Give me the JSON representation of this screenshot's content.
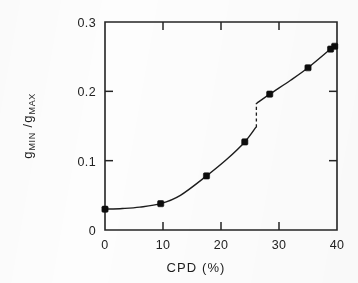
{
  "figure": {
    "background_color": "#fdfdfd",
    "ink_color": "#1c1c1c",
    "marker_color": "#0d0d0d"
  },
  "chart_data": {
    "type": "line",
    "title": "",
    "subtitle": "",
    "xlabel": "CPD (%)",
    "ylabel_main": "g",
    "ylabel_sub1": "MIN",
    "ylabel_sep": " /g",
    "ylabel_sub2": "MAX",
    "ylabel_plain": "gMIN /gMAX",
    "xlim": [
      0,
      40
    ],
    "ylim": [
      0,
      0.3
    ],
    "xticks": [
      0,
      10,
      20,
      30,
      40
    ],
    "xtick_labels": [
      "0",
      "10",
      "20",
      "30",
      "40"
    ],
    "yticks": [
      0,
      0.1,
      0.2,
      0.3
    ],
    "ytick_labels": [
      "0",
      "0.1",
      "0.2",
      "0.3"
    ],
    "grid": false,
    "legend": null,
    "frame": "box",
    "tick_direction": "in",
    "series": [
      {
        "name": "gMIN/gMAX vs CPD",
        "marker": "filled-square",
        "points": [
          {
            "x": 0.0,
            "y": 0.03
          },
          {
            "x": 9.6,
            "y": 0.038
          },
          {
            "x": 17.5,
            "y": 0.078
          },
          {
            "x": 24.1,
            "y": 0.127
          },
          {
            "x": 28.4,
            "y": 0.196
          },
          {
            "x": 35.0,
            "y": 0.234
          },
          {
            "x": 38.9,
            "y": 0.261
          },
          {
            "x": 39.6,
            "y": 0.265
          }
        ]
      }
    ],
    "curve_lower_branch": [
      {
        "x": 0.0,
        "y": 0.03
      },
      {
        "x": 3.0,
        "y": 0.031
      },
      {
        "x": 6.0,
        "y": 0.033
      },
      {
        "x": 9.6,
        "y": 0.038
      },
      {
        "x": 13.0,
        "y": 0.05
      },
      {
        "x": 17.5,
        "y": 0.078
      },
      {
        "x": 21.0,
        "y": 0.102
      },
      {
        "x": 24.1,
        "y": 0.127
      },
      {
        "x": 26.0,
        "y": 0.148
      }
    ],
    "curve_upper_branch": [
      {
        "x": 26.2,
        "y": 0.183
      },
      {
        "x": 28.4,
        "y": 0.196
      },
      {
        "x": 32.0,
        "y": 0.216
      },
      {
        "x": 35.0,
        "y": 0.234
      },
      {
        "x": 38.9,
        "y": 0.261
      },
      {
        "x": 39.8,
        "y": 0.266
      }
    ],
    "discontinuity": {
      "x": 26.1,
      "y_from": 0.148,
      "y_to": 0.183,
      "style": "dashed",
      "note": "vertical jump discontinuity"
    },
    "annotations": []
  }
}
